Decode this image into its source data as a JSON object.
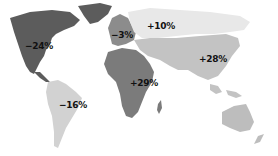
{
  "map": {
    "type": "choropleth-world",
    "regions": [
      {
        "id": "north-america",
        "name": "North America",
        "value": "−24%",
        "color": "#5c5c5c",
        "label_pos": [
          27,
          44
        ]
      },
      {
        "id": "south-america",
        "name": "South America",
        "value": "−16%",
        "color": "#d2d2d2",
        "label_pos": [
          60,
          102
        ]
      },
      {
        "id": "europe",
        "name": "Europe",
        "value": "−3%",
        "color": "#8c8c8c",
        "label_pos": [
          114,
          32
        ]
      },
      {
        "id": "russia",
        "name": "Russia",
        "value": "+10%",
        "color": "#e8e8e8",
        "label_pos": [
          147,
          23
        ]
      },
      {
        "id": "africa",
        "name": "Africa",
        "value": "+29%",
        "color": "#7b7b7b",
        "label_pos": [
          131,
          80
        ]
      },
      {
        "id": "asia",
        "name": "Asia",
        "value": "+28%",
        "color": "#c3c3c3",
        "label_pos": [
          200,
          55
        ]
      },
      {
        "id": "oceania",
        "name": "Oceania",
        "value": "",
        "color": "#bdbdbd"
      }
    ]
  }
}
